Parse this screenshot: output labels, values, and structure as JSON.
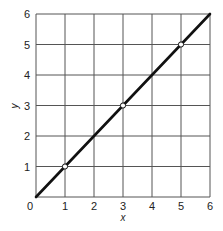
{
  "chart_data": {
    "type": "line",
    "title": "",
    "xlabel": "x",
    "ylabel": "y",
    "xlim": [
      0,
      6
    ],
    "ylim": [
      0,
      6
    ],
    "grid": true,
    "legend": null,
    "x_ticks": [
      "0",
      "1",
      "2",
      "3",
      "4",
      "5",
      "6"
    ],
    "y_ticks": [
      "1",
      "2",
      "3",
      "4",
      "5",
      "6"
    ],
    "series": [
      {
        "name": "y = x",
        "x": [
          0,
          6
        ],
        "y": [
          0,
          6
        ],
        "color": "#111111"
      }
    ],
    "markers": [
      {
        "x": 1,
        "y": 1
      },
      {
        "x": 3,
        "y": 3
      },
      {
        "x": 5,
        "y": 5
      }
    ]
  },
  "colors": {
    "grid": "#555555",
    "line": "#111111",
    "marker_fill": "#ffffff",
    "text": "#222222"
  }
}
